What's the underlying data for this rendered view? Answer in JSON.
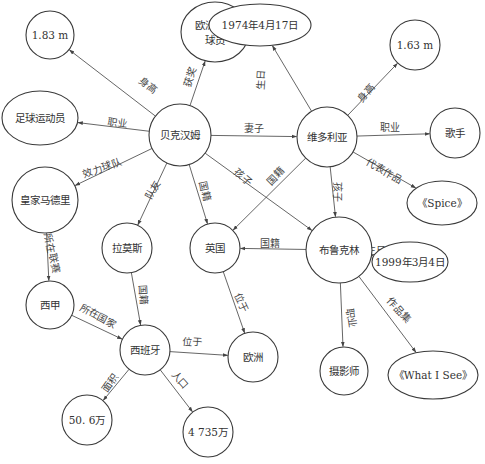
{
  "diagram": {
    "type": "knowledge-graph",
    "nodes": [
      {
        "id": "beckham",
        "label": "贝克汉姆",
        "x": 180,
        "y": 135,
        "shape": "circle",
        "r": 31
      },
      {
        "id": "h183",
        "label": "1.83 m",
        "x": 50,
        "y": 35,
        "shape": "circle",
        "r": 24
      },
      {
        "id": "award",
        "label": "欧洲最佳",
        "label2": "球员",
        "x": 215,
        "y": 32,
        "shape": "ellipse",
        "rx": 34,
        "ry": 30
      },
      {
        "id": "footballer",
        "label": "足球运动员",
        "x": 40,
        "y": 118,
        "shape": "ellipse",
        "rx": 38,
        "ry": 27
      },
      {
        "id": "realmadrid",
        "label": "皇家马德里",
        "x": 45,
        "y": 200,
        "shape": "circle",
        "r": 33
      },
      {
        "id": "ramos",
        "label": "拉莫斯",
        "x": 127,
        "y": 248,
        "shape": "circle",
        "r": 25
      },
      {
        "id": "uk",
        "label": "英国",
        "x": 215,
        "y": 248,
        "shape": "circle",
        "r": 25
      },
      {
        "id": "victoria",
        "label": "维多利亚",
        "x": 327,
        "y": 137,
        "shape": "circle",
        "r": 30
      },
      {
        "id": "bday1974",
        "label": "1974年4月17日",
        "x": 260,
        "y": 25,
        "shape": "ellipse",
        "rx": 51,
        "ry": 21
      },
      {
        "id": "h163",
        "label": "1.63 m",
        "x": 415,
        "y": 45,
        "shape": "circle",
        "r": 25
      },
      {
        "id": "singer",
        "label": "歌手",
        "x": 455,
        "y": 133,
        "shape": "circle",
        "r": 25
      },
      {
        "id": "spice",
        "label": "《Spice》",
        "x": 442,
        "y": 203,
        "shape": "ellipse",
        "rx": 35,
        "ry": 22
      },
      {
        "id": "brooklyn",
        "label": "布鲁克林",
        "x": 339,
        "y": 250,
        "shape": "circle",
        "r": 33
      },
      {
        "id": "bday1999",
        "label": "1999年3月4日",
        "x": 410,
        "y": 262,
        "shape": "ellipse",
        "rx": 38,
        "ry": 20
      },
      {
        "id": "photographer",
        "label": "摄影师",
        "x": 344,
        "y": 371,
        "shape": "circle",
        "r": 24
      },
      {
        "id": "whatisee",
        "label": "《What I See》",
        "x": 433,
        "y": 375,
        "shape": "ellipse",
        "rx": 45,
        "ry": 24
      },
      {
        "id": "laliga",
        "label": "西甲",
        "x": 50,
        "y": 305,
        "shape": "circle",
        "r": 24
      },
      {
        "id": "spain",
        "label": "西班牙",
        "x": 145,
        "y": 350,
        "shape": "circle",
        "r": 25
      },
      {
        "id": "europe",
        "label": "欧洲",
        "x": 253,
        "y": 357,
        "shape": "circle",
        "r": 25
      },
      {
        "id": "area",
        "label": "50. 6万",
        "x": 87,
        "y": 420,
        "shape": "circle",
        "r": 25
      },
      {
        "id": "population",
        "label": "4 735万",
        "x": 208,
        "y": 432,
        "shape": "circle",
        "r": 25
      }
    ],
    "edges": [
      {
        "from": "beckham",
        "to": "h183",
        "label": "身高",
        "lx": 148,
        "ly": 85,
        "rot": 38
      },
      {
        "from": "beckham",
        "to": "award",
        "label": "获奖",
        "lx": 190,
        "ly": 77,
        "rot": -70
      },
      {
        "from": "beckham",
        "to": "footballer",
        "label": "职业",
        "lx": 117,
        "ly": 123,
        "rot": 8
      },
      {
        "from": "beckham",
        "to": "realmadrid",
        "label": "效力球队",
        "lx": 102,
        "ly": 168,
        "rot": -20
      },
      {
        "from": "beckham",
        "to": "ramos",
        "label": "队友",
        "lx": 153,
        "ly": 190,
        "rot": -62
      },
      {
        "from": "beckham",
        "to": "uk",
        "label": "国籍",
        "lx": 205,
        "ly": 191,
        "rot": 78
      },
      {
        "from": "beckham",
        "to": "victoria",
        "label": "妻子",
        "lx": 254,
        "ly": 128,
        "rot": 0
      },
      {
        "from": "beckham",
        "to": "brooklyn",
        "label": "孩子",
        "lx": 243,
        "ly": 177,
        "rot": 40
      },
      {
        "from": "victoria",
        "to": "bday1974",
        "label": "生日",
        "lx": 261,
        "ly": 80,
        "rot": -86
      },
      {
        "from": "victoria",
        "to": "h163",
        "label": "身高",
        "lx": 366,
        "ly": 93,
        "rot": -50
      },
      {
        "from": "victoria",
        "to": "singer",
        "label": "职业",
        "lx": 390,
        "ly": 127,
        "rot": 0
      },
      {
        "from": "victoria",
        "to": "spice",
        "label": "代表作品",
        "lx": 384,
        "ly": 171,
        "rot": 30
      },
      {
        "from": "victoria",
        "to": "uk",
        "label": "国籍",
        "lx": 276,
        "ly": 176,
        "rot": -45
      },
      {
        "from": "victoria",
        "to": "brooklyn",
        "label": "孩子",
        "lx": 337,
        "ly": 192,
        "rot": 90
      },
      {
        "from": "brooklyn",
        "to": "uk",
        "label": "国籍",
        "lx": 270,
        "ly": 243,
        "rot": 0
      },
      {
        "from": "brooklyn",
        "to": "bday1999",
        "label": "生日",
        "lx": 376,
        "ly": 250,
        "rot": 0
      },
      {
        "from": "brooklyn",
        "to": "photographer",
        "label": "职业",
        "lx": 351,
        "ly": 318,
        "rot": 82
      },
      {
        "from": "brooklyn",
        "to": "whatisee",
        "label": "作品集",
        "lx": 399,
        "ly": 310,
        "rot": 48
      },
      {
        "from": "realmadrid",
        "to": "laliga",
        "label": "所在联赛",
        "lx": 52,
        "ly": 253,
        "rot": 78
      },
      {
        "from": "ramos",
        "to": "spain",
        "label": "国籍",
        "lx": 143,
        "ly": 295,
        "rot": 87
      },
      {
        "from": "uk",
        "to": "europe",
        "label": "位于",
        "lx": 241,
        "ly": 303,
        "rot": 65
      },
      {
        "from": "laliga",
        "to": "spain",
        "label": "所在国家",
        "lx": 98,
        "ly": 316,
        "rot": 28
      },
      {
        "from": "spain",
        "to": "europe",
        "label": "位于",
        "lx": 192,
        "ly": 342,
        "rot": 5
      },
      {
        "from": "spain",
        "to": "area",
        "label": "面积",
        "lx": 110,
        "ly": 383,
        "rot": -55
      },
      {
        "from": "spain",
        "to": "population",
        "label": "人口",
        "lx": 180,
        "ly": 380,
        "rot": 48
      }
    ]
  },
  "colors": {
    "stroke": "#3a3a3a",
    "edge": "#555555",
    "text": "#333333",
    "background": "#ffffff"
  }
}
